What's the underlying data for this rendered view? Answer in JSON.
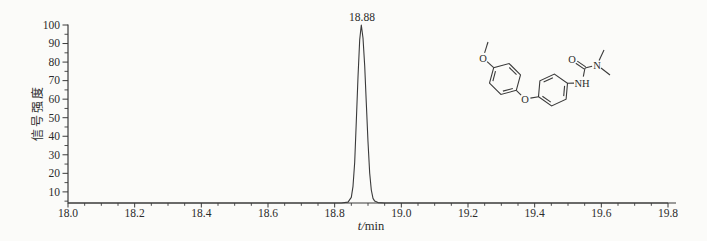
{
  "chart_data": {
    "type": "line",
    "title": "",
    "xlabel": "t/min",
    "ylabel": "信号强度",
    "xlim": [
      18.0,
      19.8
    ],
    "ylim": [
      4,
      100
    ],
    "grid": false,
    "legend": false,
    "line_color": "#3a3a3a",
    "x_tick_labels": [
      "18.0",
      "18.2",
      "18.4",
      "18.6",
      "18.8",
      "19.0",
      "19.2",
      "19.4",
      "19.6",
      "19.8"
    ],
    "y_tick_labels": [
      "10",
      "20",
      "30",
      "40",
      "50",
      "60",
      "70",
      "80",
      "90",
      "100"
    ],
    "x_minor_step": 0.05,
    "y_minor_step": 5,
    "peak_label": {
      "text": "18.88",
      "t": 18.88,
      "v": 100
    },
    "series": [
      {
        "name": "chromatogram",
        "points": [
          [
            18.0,
            4
          ],
          [
            18.3,
            4
          ],
          [
            18.6,
            4
          ],
          [
            18.78,
            4
          ],
          [
            18.82,
            4
          ],
          [
            18.84,
            4.5
          ],
          [
            18.85,
            7
          ],
          [
            18.855,
            13
          ],
          [
            18.86,
            26
          ],
          [
            18.865,
            48
          ],
          [
            18.87,
            72
          ],
          [
            18.875,
            92
          ],
          [
            18.88,
            100
          ],
          [
            18.885,
            93
          ],
          [
            18.89,
            78
          ],
          [
            18.895,
            58
          ],
          [
            18.9,
            37
          ],
          [
            18.905,
            20
          ],
          [
            18.91,
            11
          ],
          [
            18.915,
            6.5
          ],
          [
            18.92,
            5
          ],
          [
            18.93,
            4.2
          ],
          [
            18.95,
            4
          ],
          [
            19.1,
            4
          ],
          [
            19.4,
            4
          ],
          [
            19.8,
            4
          ]
        ]
      }
    ]
  },
  "structure": {
    "atom_labels": {
      "methoxy_o": "O",
      "ether_o": "O",
      "carbonyl_o": "O",
      "urea_nh": "NH",
      "urea_n": "N"
    }
  }
}
